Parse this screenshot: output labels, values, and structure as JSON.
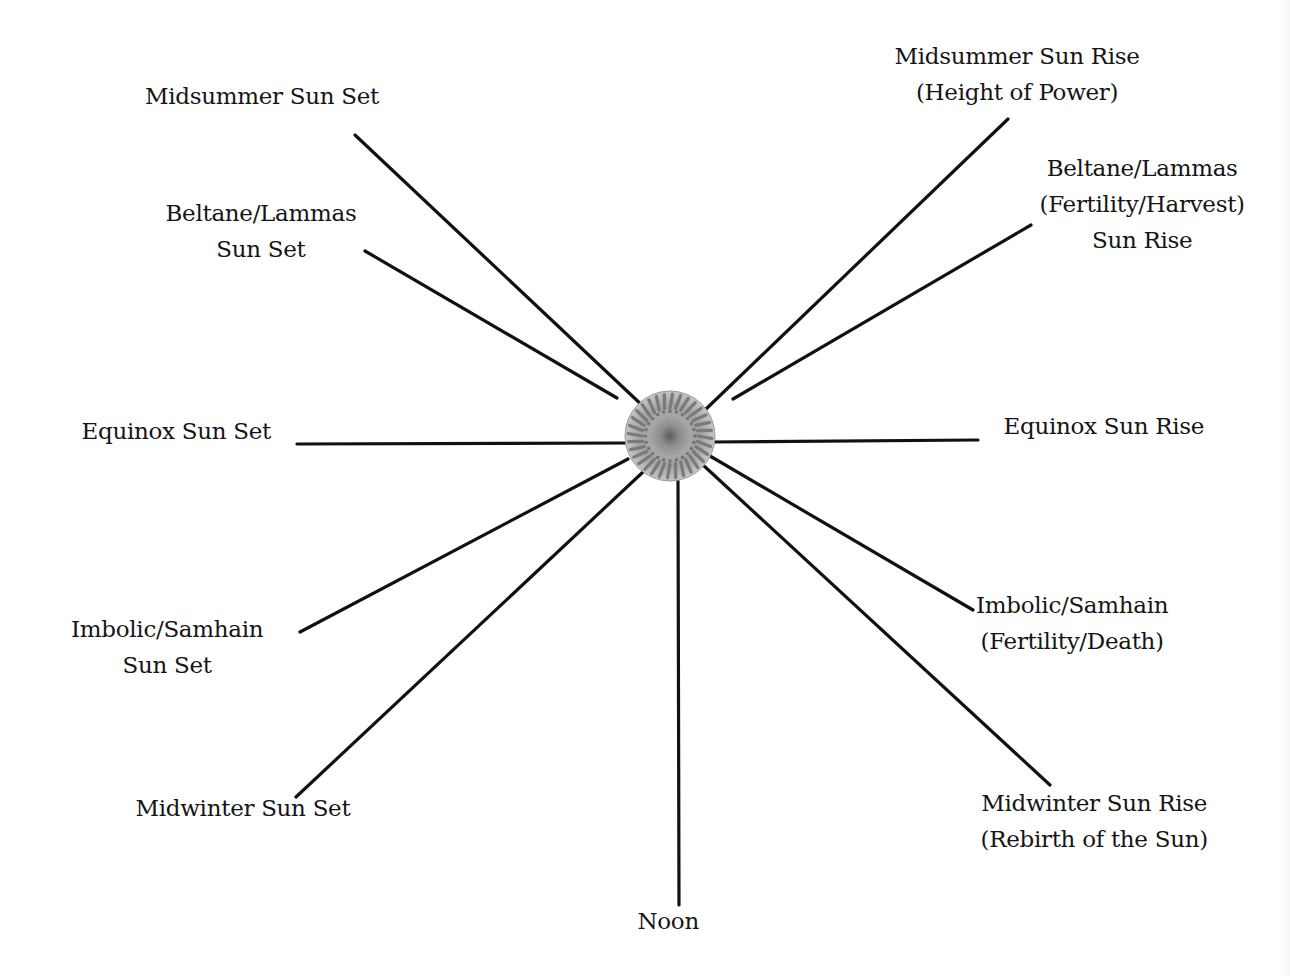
{
  "diagram": {
    "title": "",
    "center": {
      "name": "sun",
      "icon": "sun-disc-icon",
      "x": 670,
      "y": 436,
      "radius": 45,
      "colors": {
        "outer": "#b8b8b8",
        "rays": "#7a7a7a",
        "inner": "#8e8e8e",
        "core": "#6a6a6a"
      }
    },
    "line_color": "#111111",
    "line_width": 3.2,
    "spokes": [
      {
        "id": "midsummer-sun-set",
        "label_lines": [
          "Midsummer Sun Set"
        ],
        "line": {
          "x1": 355,
          "y1": 135,
          "x2": 645,
          "y2": 408
        },
        "label_pos": {
          "x": 262,
          "y": 78
        }
      },
      {
        "id": "beltane-lammas-sun-set",
        "label_lines": [
          "Beltane/Lammas",
          "Sun Set"
        ],
        "line": {
          "x1": 365,
          "y1": 251,
          "x2": 617,
          "y2": 398
        },
        "label_pos": {
          "x": 261,
          "y": 195
        }
      },
      {
        "id": "equinox-sun-set",
        "label_lines": [
          "Equinox Sun Set"
        ],
        "line": {
          "x1": 297,
          "y1": 444,
          "x2": 628,
          "y2": 443
        },
        "label_pos": {
          "x": 176,
          "y": 413
        }
      },
      {
        "id": "imbolic-samhain-sun-set",
        "label_lines": [
          "Imbolic/Samhain",
          "Sun Set"
        ],
        "line": {
          "x1": 300,
          "y1": 632,
          "x2": 628,
          "y2": 459
        },
        "label_pos": {
          "x": 167,
          "y": 611
        }
      },
      {
        "id": "midwinter-sun-set",
        "label_lines": [
          "Midwinter Sun Set"
        ],
        "line": {
          "x1": 296,
          "y1": 797,
          "x2": 643,
          "y2": 472
        },
        "label_pos": {
          "x": 243,
          "y": 790
        }
      },
      {
        "id": "noon",
        "label_lines": [
          "Noon"
        ],
        "line": {
          "x1": 678,
          "y1": 481,
          "x2": 679,
          "y2": 905
        },
        "label_pos": {
          "x": 668,
          "y": 903
        }
      },
      {
        "id": "midwinter-sun-rise",
        "label_lines": [
          "Midwinter Sun Rise",
          "(Rebirth of the Sun)"
        ],
        "line": {
          "x1": 703,
          "y1": 465,
          "x2": 1050,
          "y2": 785
        },
        "label_pos": {
          "x": 1094,
          "y": 785
        }
      },
      {
        "id": "imbolic-samhain-sun-rise",
        "label_lines": [
          "Imbolic/Samhain",
          "(Fertility/Death)"
        ],
        "line": {
          "x1": 710,
          "y1": 456,
          "x2": 973,
          "y2": 610
        },
        "label_pos": {
          "x": 1072,
          "y": 587
        }
      },
      {
        "id": "equinox-sun-rise",
        "label_lines": [
          "Equinox Sun Rise"
        ],
        "line": {
          "x1": 712,
          "y1": 442,
          "x2": 978,
          "y2": 440
        },
        "label_pos": {
          "x": 1104,
          "y": 408
        }
      },
      {
        "id": "beltane-lammas-sun-rise",
        "label_lines": [
          "Beltane/Lammas",
          "(Fertility/Harvest)",
          "Sun Rise"
        ],
        "line": {
          "x1": 733,
          "y1": 399,
          "x2": 1031,
          "y2": 225
        },
        "label_pos": {
          "x": 1142,
          "y": 150
        }
      },
      {
        "id": "midsummer-sun-rise",
        "label_lines": [
          "Midsummer Sun Rise",
          "(Height of Power)"
        ],
        "line": {
          "x1": 705,
          "y1": 410,
          "x2": 1008,
          "y2": 119
        },
        "label_pos": {
          "x": 1017,
          "y": 38
        }
      }
    ]
  }
}
